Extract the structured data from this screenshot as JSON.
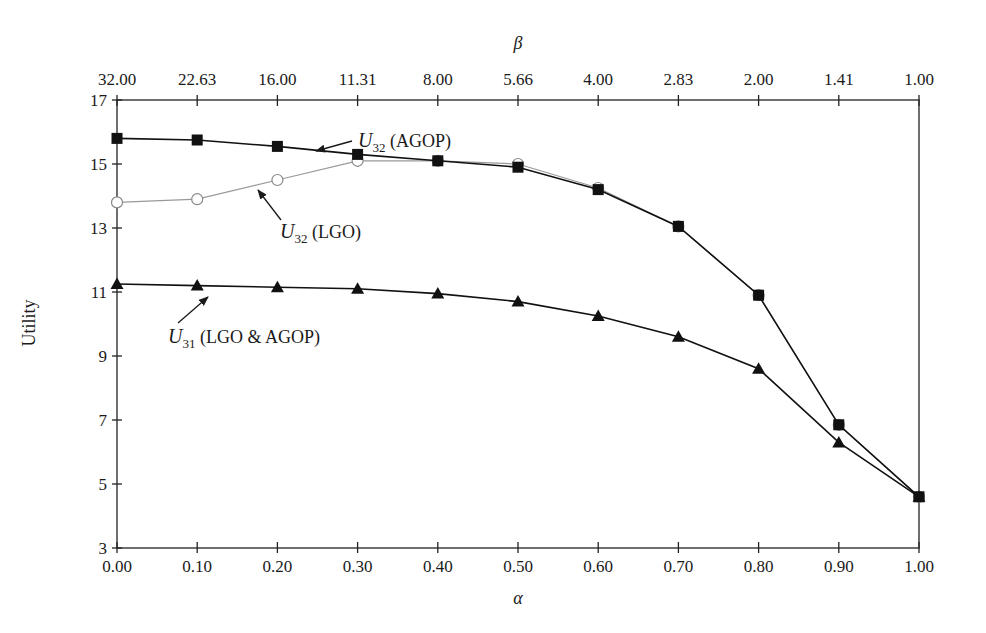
{
  "chart_data": {
    "type": "line",
    "title": "",
    "xlabel": "α",
    "ylabel": "Utility",
    "x2label": "β",
    "x": [
      0.0,
      0.1,
      0.2,
      0.3,
      0.4,
      0.5,
      0.6,
      0.7,
      0.8,
      0.9,
      1.0
    ],
    "x_tick_labels": [
      "0.00",
      "0.10",
      "0.20",
      "0.30",
      "0.40",
      "0.50",
      "0.60",
      "0.70",
      "0.80",
      "0.90",
      "1.00"
    ],
    "x2_tick_labels": [
      "32.00",
      "22.63",
      "16.00",
      "11.31",
      "8.00",
      "5.66",
      "4.00",
      "2.83",
      "2.00",
      "1.41",
      "1.00"
    ],
    "y_ticks": [
      3,
      5,
      7,
      9,
      11,
      13,
      15,
      17
    ],
    "ylim": [
      3,
      17
    ],
    "xlim": [
      0,
      1
    ],
    "grid": false,
    "legend": "inline annotations with arrows",
    "series": [
      {
        "name": "U32 (AGOP)",
        "marker": "square",
        "color": "#111111",
        "values": [
          15.8,
          15.75,
          15.55,
          15.3,
          15.1,
          14.9,
          14.2,
          13.05,
          10.9,
          6.85,
          4.6
        ]
      },
      {
        "name": "U32 (LGO)",
        "marker": "open-circle",
        "color": "#999999",
        "values": [
          13.8,
          13.9,
          14.5,
          15.1,
          15.1,
          15.0,
          14.25,
          13.05,
          10.9,
          6.85,
          4.6
        ]
      },
      {
        "name": "U31 (LGO & AGOP)",
        "marker": "triangle",
        "color": "#111111",
        "values": [
          11.25,
          11.2,
          11.15,
          11.1,
          10.95,
          10.7,
          10.25,
          9.6,
          8.6,
          6.3,
          4.6
        ]
      }
    ],
    "annotations": [
      {
        "main": "U",
        "sub": "32",
        "rest": " (AGOP)",
        "text_x": 358,
        "text_y": 147,
        "arrow_from": [
          352,
          141
        ],
        "arrow_to": [
          316,
          151
        ]
      },
      {
        "main": "U",
        "sub": "32",
        "rest": " (LGO)",
        "text_x": 280,
        "text_y": 238,
        "arrow_from": [
          281,
          220
        ],
        "arrow_to": [
          258,
          190
        ]
      },
      {
        "main": "U",
        "sub": "31",
        "rest": " (LGO & AGOP)",
        "text_x": 168,
        "text_y": 343,
        "arrow_from": [
          178,
          323
        ],
        "arrow_to": [
          208,
          297
        ]
      }
    ]
  }
}
